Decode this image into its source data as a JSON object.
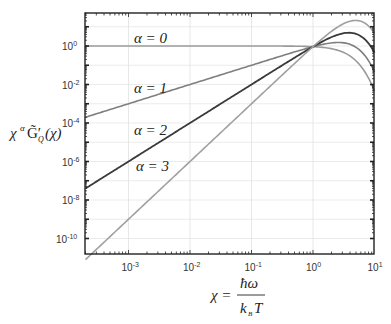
{
  "chart_data": {
    "type": "line",
    "title": "",
    "xlabel": "χ = ħω / k_B T",
    "ylabel": "χ^α G̃'_Q(χ)",
    "xscale": "log",
    "yscale": "log",
    "xlim": [
      0.0002,
      10
    ],
    "ylim": [
      1.2e-11,
      50
    ],
    "grid": true,
    "legend": "inline labels",
    "x_ticks": [
      {
        "exp": "-3",
        "value": 0.001
      },
      {
        "exp": "-2",
        "value": 0.01
      },
      {
        "exp": "-1",
        "value": 0.1
      },
      {
        "exp": "0",
        "value": 1
      },
      {
        "exp": "1",
        "value": 10
      }
    ],
    "y_ticks": [
      {
        "exp": "0",
        "value": 1
      },
      {
        "exp": "-2",
        "value": 0.01
      },
      {
        "exp": "-4",
        "value": 0.0001
      },
      {
        "exp": "-6",
        "value": 1e-06
      },
      {
        "exp": "-8",
        "value": 1e-08
      },
      {
        "exp": "-10",
        "value": 1e-10
      }
    ],
    "x": [
      0.0002,
      0.001,
      0.01,
      0.1,
      0.3,
      1,
      2,
      3,
      4,
      5,
      6,
      7,
      8,
      10
    ],
    "base_G": [
      1.0,
      1.0,
      0.99999,
      0.99917,
      0.9925,
      0.9207,
      0.7241,
      0.4963,
      0.3041,
      0.1707,
      0.0897,
      0.0448,
      0.0215,
      0.00454
    ],
    "series": [
      {
        "name": "α = 0",
        "alpha": 0,
        "color": "#9a9a9a",
        "label_text": "α = 0",
        "values": [
          1.0,
          1.0,
          0.99999,
          0.99917,
          0.9925,
          0.9207,
          0.7241,
          0.4963,
          0.3041,
          0.1707,
          0.0897,
          0.0448,
          0.0215,
          0.00454
        ]
      },
      {
        "name": "α = 1",
        "alpha": 1,
        "color": "#7f7f7f",
        "label_text": "α = 1",
        "values": [
          0.0002,
          0.001,
          0.01,
          0.0999,
          0.2978,
          0.9207,
          1.448,
          1.489,
          1.216,
          0.854,
          0.538,
          0.314,
          0.172,
          0.0454
        ]
      },
      {
        "name": "α = 2",
        "alpha": 2,
        "color": "#3a3a3a",
        "label_text": "α = 2",
        "values": [
          4e-08,
          1e-06,
          0.0001,
          0.00999,
          0.0893,
          0.9207,
          2.896,
          4.467,
          4.866,
          4.268,
          3.229,
          2.195,
          1.376,
          0.454
        ]
      },
      {
        "name": "α = 3",
        "alpha": 3,
        "color": "#a0a0a0",
        "label_text": "α = 3",
        "values": [
          8e-12,
          1e-09,
          1e-06,
          0.000999,
          0.0268,
          0.9207,
          5.793,
          13.4,
          19.46,
          21.34,
          19.38,
          15.37,
          11.01,
          4.54
        ]
      }
    ]
  },
  "labels": {
    "alpha0": "α = 0",
    "alpha1": "α = 1",
    "alpha2": "α = 2",
    "alpha3": "α = 3",
    "ten": "10"
  },
  "axes": {
    "y_label_main": "χ",
    "y_label_sup": "α",
    "y_label_G": "G̃′",
    "y_label_sub": "Q",
    "y_label_arg": "(χ)",
    "x_label_lhs": "χ =",
    "x_label_num": "ħω",
    "x_label_den_k": "k",
    "x_label_den_sub": "B",
    "x_label_den_T": "T"
  }
}
